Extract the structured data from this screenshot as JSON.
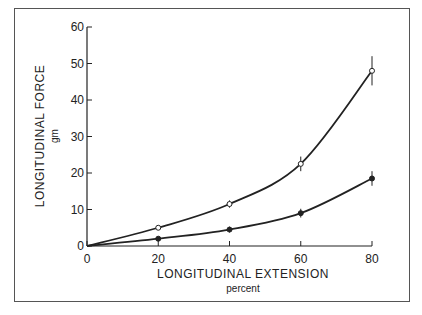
{
  "chart_data": {
    "type": "line",
    "title": "",
    "xlabel": "LONGITUDINAL EXTENSION",
    "xunit": "percent",
    "ylabel": "LONGITUDINAL FORCE",
    "yunit": "gm",
    "x": [
      0,
      20,
      40,
      60,
      80
    ],
    "xticks": [
      "0",
      "20",
      "40",
      "60",
      "80"
    ],
    "yticks": [
      "0",
      "10",
      "20",
      "30",
      "40",
      "50",
      "60"
    ],
    "xlim": [
      0,
      80
    ],
    "ylim": [
      0,
      60
    ],
    "grid": false,
    "series": [
      {
        "name": "open circles",
        "marker": "open",
        "values": [
          0,
          5,
          11.5,
          22.5,
          48
        ],
        "errors": [
          0,
          0.5,
          1,
          2,
          4
        ]
      },
      {
        "name": "filled circles",
        "marker": "filled",
        "values": [
          0,
          2,
          4.5,
          9,
          18.5
        ],
        "errors": [
          0,
          0.5,
          0.8,
          1.2,
          2
        ]
      }
    ]
  }
}
